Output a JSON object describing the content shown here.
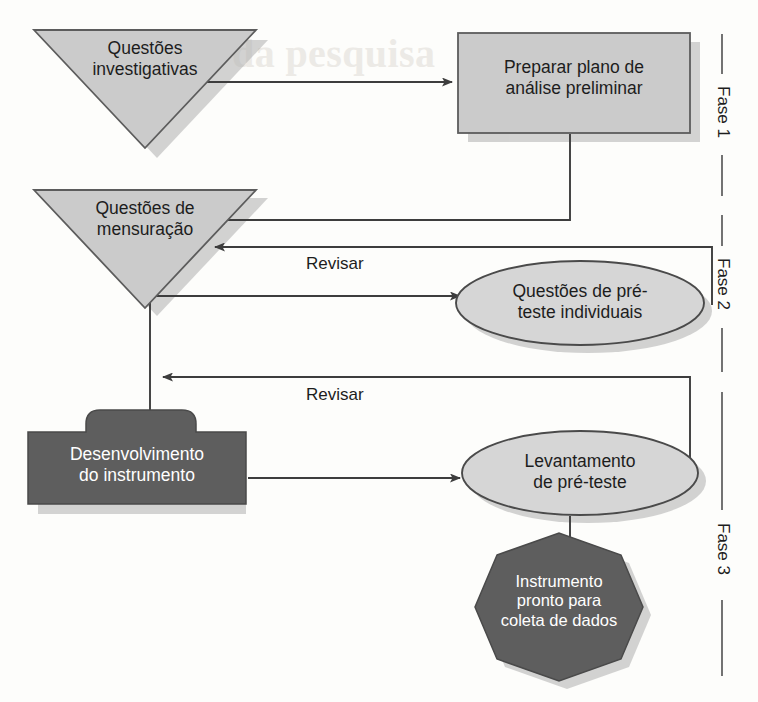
{
  "diagram": {
    "colors": {
      "light_fill": "#cccccc",
      "dark_fill": "#5a5a5a",
      "stroke": "#4a4a4a",
      "shadow": "#b3b3b3",
      "text_dark": "#1d1d1d",
      "text_light": "#ffffff",
      "background": "#fdfdfb"
    },
    "nodes": [
      {
        "id": "questoes-investigativas",
        "shape": "triangle-down",
        "label": "Questões\ninvestigativas",
        "fill": "light",
        "phase": "Fase 1"
      },
      {
        "id": "preparar-plano",
        "shape": "rectangle",
        "label": "Preparar plano de\nanálise preliminar",
        "fill": "light",
        "phase": "Fase 1"
      },
      {
        "id": "questoes-mensuracao",
        "shape": "triangle-down",
        "label": "Questões de\nmensuração",
        "fill": "light",
        "phase": "Fase 2"
      },
      {
        "id": "questoes-pre-teste",
        "shape": "ellipse",
        "label": "Questões de pré-\nteste individuais",
        "fill": "light",
        "phase": "Fase 2"
      },
      {
        "id": "desenvolvimento-instrumento",
        "shape": "tabbed-rectangle",
        "label": "Desenvolvimento\ndo instrumento",
        "fill": "dark",
        "phase": "Fase 3"
      },
      {
        "id": "levantamento-pre-teste",
        "shape": "ellipse",
        "label": "Levantamento\nde pré-teste",
        "fill": "light",
        "phase": "Fase 3"
      },
      {
        "id": "instrumento-pronto",
        "shape": "octagon",
        "label": "Instrumento\npronto para\ncoleta de dados",
        "fill": "dark",
        "phase": "Fase 3"
      }
    ],
    "edges": [
      {
        "from": "questoes-investigativas",
        "to": "preparar-plano",
        "label": ""
      },
      {
        "from": "preparar-plano",
        "to": "questoes-mensuracao",
        "label": ""
      },
      {
        "from": "questoes-mensuracao",
        "to": "questoes-pre-teste",
        "label": ""
      },
      {
        "from": "questoes-pre-teste",
        "to": "questoes-mensuracao",
        "label": "Revisar"
      },
      {
        "from": "questoes-mensuracao",
        "to": "desenvolvimento-instrumento",
        "label": ""
      },
      {
        "from": "levantamento-pre-teste",
        "to": "desenvolvimento-instrumento",
        "label": "Revisar"
      },
      {
        "from": "desenvolvimento-instrumento",
        "to": "levantamento-pre-teste",
        "label": ""
      },
      {
        "from": "levantamento-pre-teste",
        "to": "instrumento-pronto",
        "label": ""
      }
    ],
    "edge_labels": {
      "revisar_upper": "Revisar",
      "revisar_lower": "Revisar"
    },
    "phases": [
      {
        "id": "fase-1",
        "label": "Fase 1"
      },
      {
        "id": "fase-2",
        "label": "Fase 2"
      },
      {
        "id": "fase-3",
        "label": "Fase 3"
      }
    ],
    "bleed_text": {
      "header": "da pesquisa",
      "line_a": "sa",
      "line_b": "do"
    }
  }
}
